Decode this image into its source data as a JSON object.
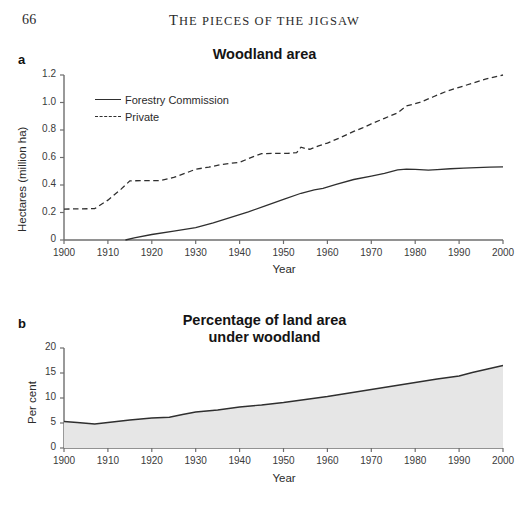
{
  "page": {
    "folio": "66",
    "running_head": "The pieces of the jigsaw",
    "running_head_first": "T",
    "running_head_rest": "HE PIECES OF THE JIGSAW"
  },
  "panel_a": {
    "label": "a",
    "title": "Woodland area",
    "legend": [
      {
        "label": "Forestry Commission",
        "style": "solid"
      },
      {
        "label": "Private",
        "style": "dashed"
      }
    ]
  },
  "panel_b": {
    "label": "b",
    "title_line1": "Percentage of land area",
    "title_line2": "under woodland"
  },
  "colors": {
    "line": "#2f2f2f",
    "axis": "#6e6e6e",
    "area_fill": "#e6e6e6",
    "text": "#2b2b2b"
  },
  "chart_data": [
    {
      "type": "line",
      "id": "woodland-area",
      "title": "Woodland area",
      "panel": "a",
      "xlabel": "Year",
      "ylabel": "Hectares (million ha)",
      "xlim": [
        1900,
        2000
      ],
      "ylim": [
        0,
        1.2
      ],
      "xticks": [
        1900,
        1910,
        1920,
        1930,
        1940,
        1950,
        1960,
        1970,
        1980,
        1990,
        2000
      ],
      "yticks": [
        0,
        0.2,
        0.4,
        0.6,
        0.8,
        1.0,
        1.2
      ],
      "ytick_labels": [
        "0",
        "0.2",
        "0.4",
        "0.6",
        "0.8",
        "1.0",
        "1.2"
      ],
      "grid": false,
      "legend_position": "upper-left-inside",
      "series": [
        {
          "name": "Forestry Commission",
          "style": "solid",
          "x": [
            1914,
            1916,
            1920,
            1925,
            1930,
            1934,
            1938,
            1942,
            1946,
            1950,
            1954,
            1957,
            1959,
            1962,
            1966,
            1970,
            1973,
            1976,
            1978,
            1980,
            1983,
            1985,
            1988,
            1991,
            1994,
            1997,
            2000
          ],
          "y": [
            0.0,
            0.015,
            0.04,
            0.065,
            0.09,
            0.125,
            0.165,
            0.205,
            0.25,
            0.295,
            0.34,
            0.365,
            0.375,
            0.405,
            0.44,
            0.465,
            0.485,
            0.51,
            0.515,
            0.513,
            0.508,
            0.512,
            0.518,
            0.522,
            0.527,
            0.53,
            0.532
          ]
        },
        {
          "name": "Private",
          "style": "dashed",
          "x": [
            1900,
            1904,
            1907,
            1910,
            1913,
            1915,
            1918,
            1922,
            1925,
            1928,
            1930,
            1933,
            1936,
            1940,
            1943,
            1945,
            1948,
            1951,
            1953,
            1954,
            1955,
            1956,
            1958,
            1960,
            1963,
            1966,
            1968,
            1970,
            1973,
            1976,
            1978,
            1981,
            1984,
            1987,
            1990,
            1993,
            1996,
            2000
          ],
          "y": [
            0.225,
            0.227,
            0.228,
            0.29,
            0.37,
            0.43,
            0.432,
            0.432,
            0.455,
            0.49,
            0.515,
            0.53,
            0.55,
            0.565,
            0.605,
            0.628,
            0.63,
            0.63,
            0.635,
            0.675,
            0.665,
            0.66,
            0.685,
            0.705,
            0.745,
            0.79,
            0.815,
            0.845,
            0.885,
            0.925,
            0.975,
            1.0,
            1.04,
            1.08,
            1.11,
            1.14,
            1.17,
            1.2
          ]
        }
      ]
    },
    {
      "type": "area",
      "id": "percentage-land-under-woodland",
      "title": "Percentage of land area under woodland",
      "panel": "b",
      "xlabel": "Year",
      "ylabel": "Per cent",
      "xlim": [
        1900,
        2000
      ],
      "ylim": [
        0,
        20
      ],
      "xticks": [
        1900,
        1910,
        1920,
        1930,
        1940,
        1950,
        1960,
        1970,
        1980,
        1990,
        2000
      ],
      "yticks": [
        0,
        5,
        10,
        15,
        20
      ],
      "ytick_labels": [
        "0",
        "5",
        "10",
        "15",
        "20"
      ],
      "grid": false,
      "legend_position": "none",
      "series": [
        {
          "name": "Per cent of land area under woodland",
          "style": "area",
          "x": [
            1900,
            1903,
            1907,
            1910,
            1915,
            1920,
            1924,
            1927,
            1930,
            1935,
            1940,
            1945,
            1950,
            1955,
            1960,
            1965,
            1970,
            1975,
            1980,
            1985,
            1990,
            1993,
            1996,
            2000
          ],
          "y": [
            5.3,
            5.1,
            4.8,
            5.1,
            5.6,
            6.0,
            6.15,
            6.7,
            7.2,
            7.6,
            8.2,
            8.6,
            9.1,
            9.7,
            10.3,
            11.0,
            11.7,
            12.4,
            13.1,
            13.8,
            14.4,
            15.1,
            15.7,
            16.5
          ]
        }
      ]
    }
  ]
}
